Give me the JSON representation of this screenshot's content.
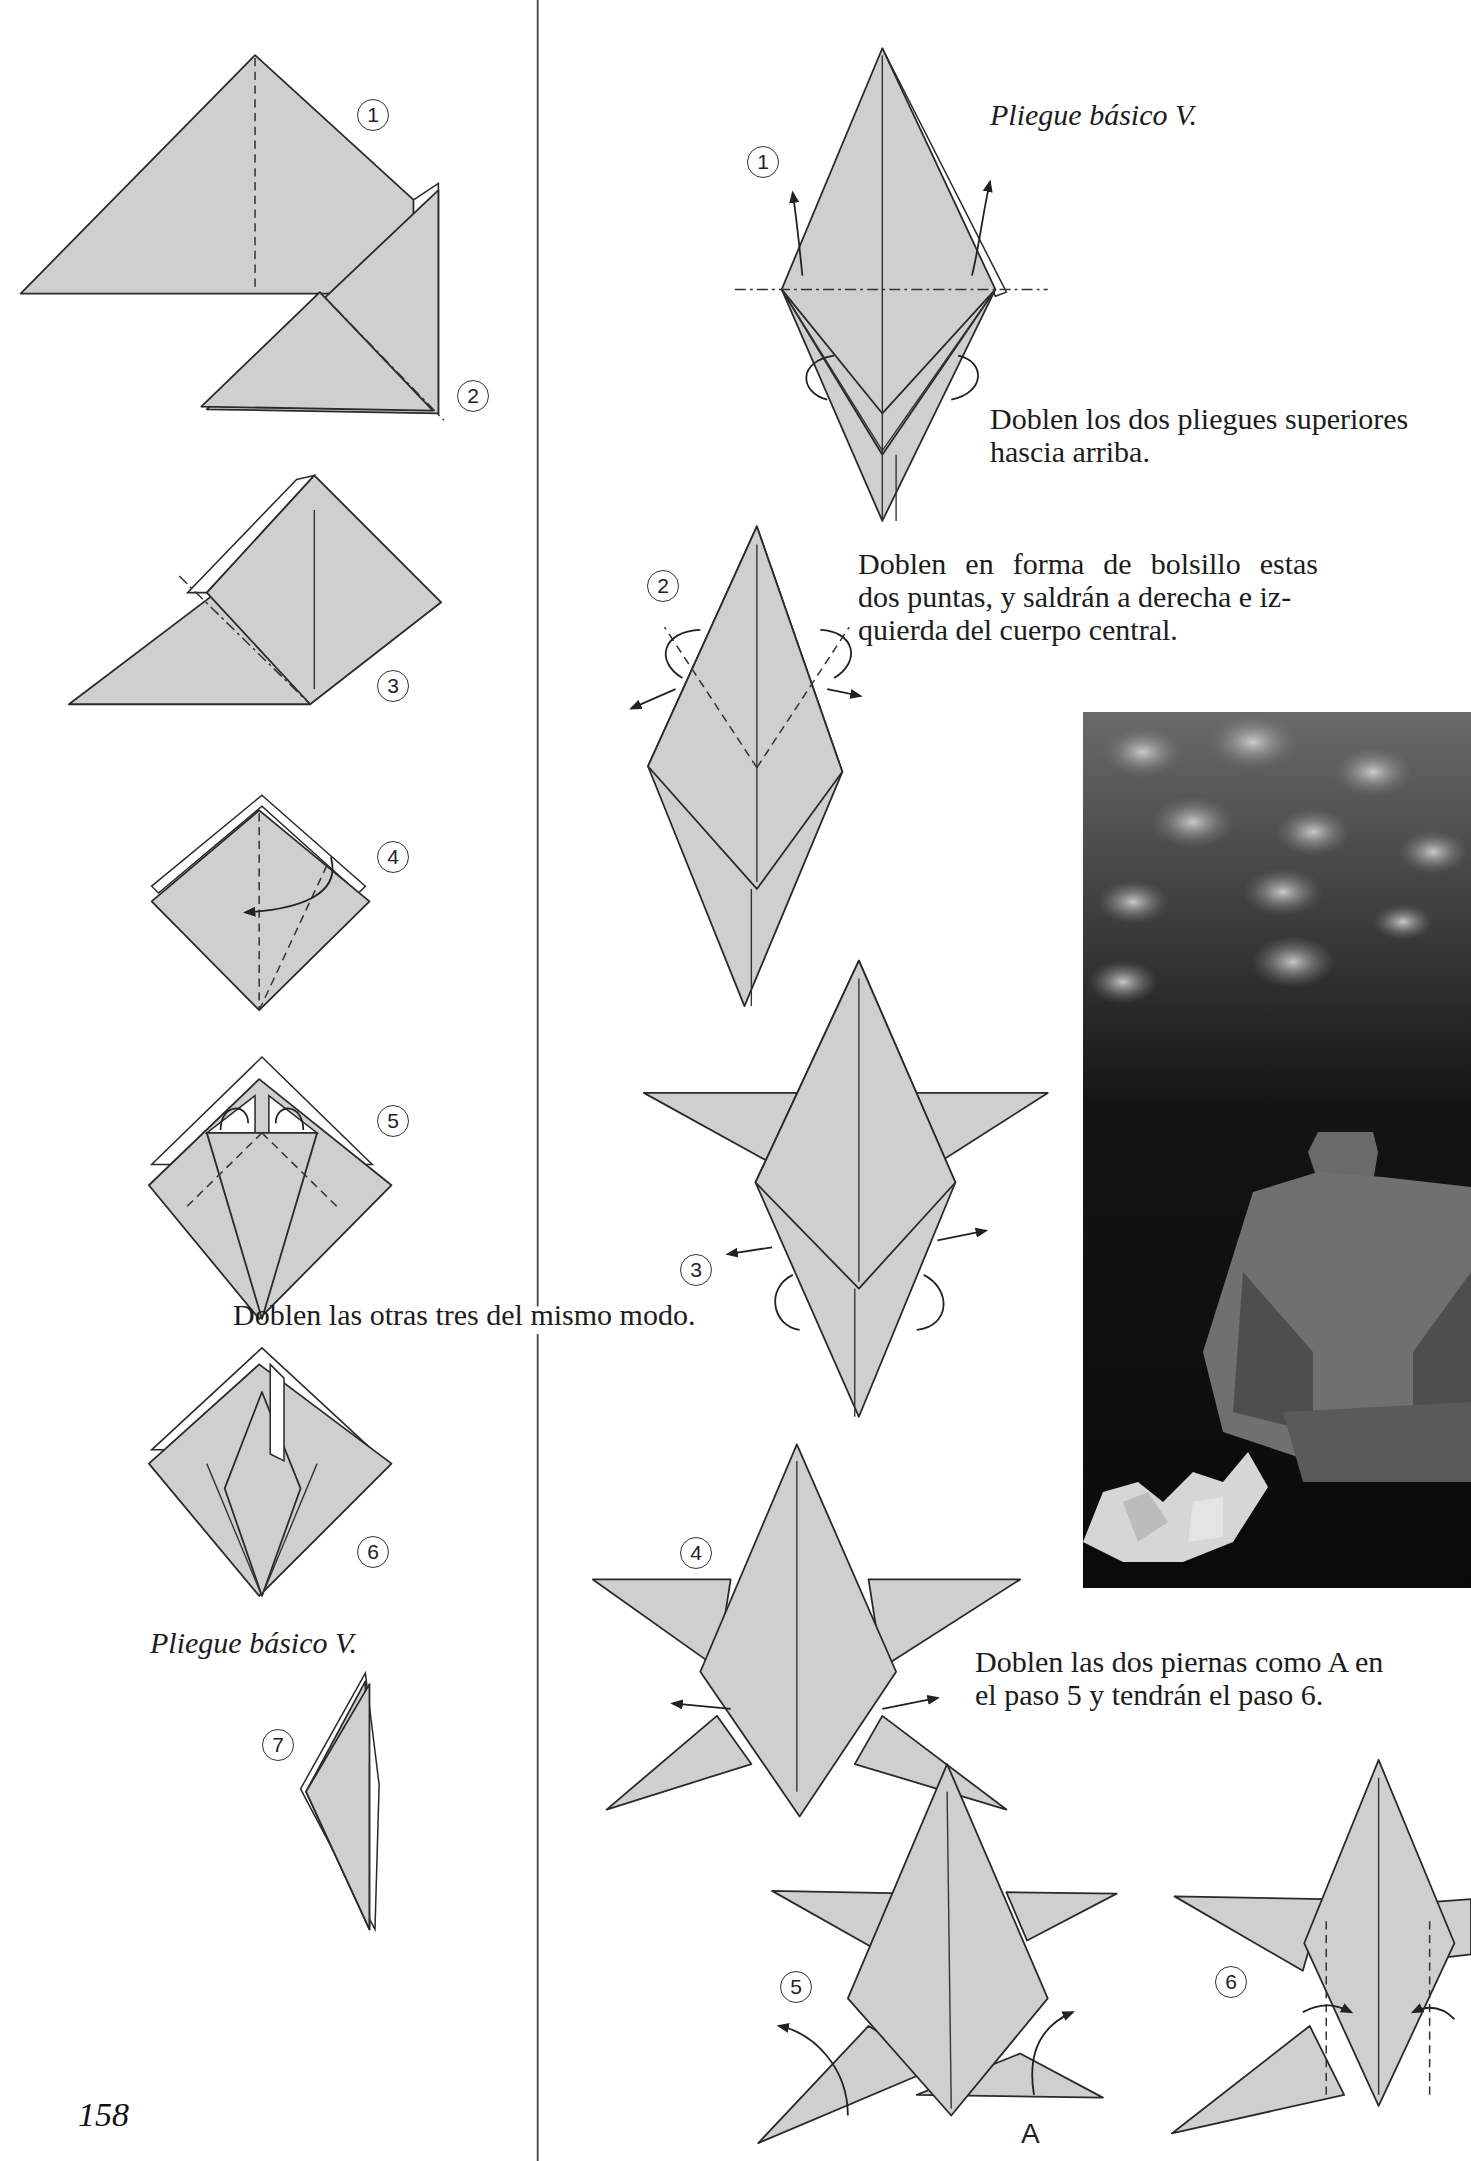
{
  "page": {
    "page_number": "158",
    "paper_color": "#cfcfcf",
    "ink_color": "#2a2a2a"
  },
  "left_column": {
    "steps": [
      {
        "number": "1"
      },
      {
        "number": "2"
      },
      {
        "number": "3"
      },
      {
        "number": "4"
      },
      {
        "number": "5"
      },
      {
        "number": "6"
      },
      {
        "number": "7"
      }
    ],
    "caption_repeat": "Doblen las otras tres del mismo modo.",
    "caption_base": "Pliegue básico V."
  },
  "right_column": {
    "caption_base": "Pliegue básico V.",
    "steps": [
      {
        "number": "1",
        "instruction_line1": "Doblen los dos pliegues superiores",
        "instruction_line2": "hascia arriba."
      },
      {
        "number": "2",
        "instruction_line1": "Doblen en forma de bolsillo estas",
        "instruction_line2": "dos puntas, y saldrán a derecha e iz-",
        "instruction_line3": "quierda del cuerpo central."
      },
      {
        "number": "3"
      },
      {
        "number": "4",
        "instruction_line1": "Doblen las dos piernas como A en",
        "instruction_line2": "el paso 5 y tendrán el paso 6."
      },
      {
        "number": "5",
        "point_label": "A"
      },
      {
        "number": "6"
      }
    ]
  },
  "photo": {
    "subject": "origami-frog-with-water-lily",
    "tone": "black-and-white"
  }
}
